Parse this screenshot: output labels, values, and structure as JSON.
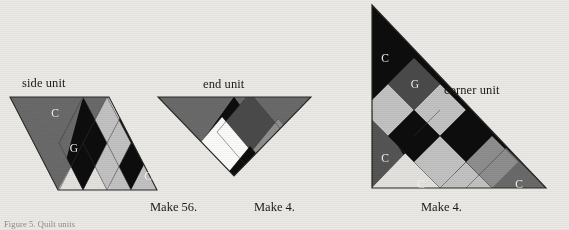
{
  "page": {
    "background_color": "#eceae6",
    "caption": "Figure 5. Quilt units"
  },
  "palette": {
    "black": "#0d0d0d",
    "dark_gray": "#4a4a4a",
    "medium_gray": "#8e8e8e",
    "light_gray": "#c2c2c2",
    "pale": "#e4e2de",
    "white": "#fbfbfa",
    "outline": "#2a2825",
    "label_text": "#1c1a18"
  },
  "units": [
    {
      "id": "side-unit",
      "title": "side unit",
      "make_label": "Make 56.",
      "shape": "parallelogram",
      "patch_labels": [
        {
          "text": "C",
          "x": 55,
          "y": 117
        },
        {
          "text": "G",
          "x": 74,
          "y": 150
        },
        {
          "text": "C",
          "x": 148,
          "y": 178
        }
      ]
    },
    {
      "id": "end-unit",
      "title": "end unit",
      "make_label": "Make 4.",
      "shape": "inverted-triangle",
      "patch_labels": []
    },
    {
      "id": "corner-unit",
      "title": "corner unit",
      "make_label": "Make 4.",
      "shape": "right-triangle",
      "patch_labels": [
        {
          "text": "C",
          "x": 385,
          "y": 61
        },
        {
          "text": "G",
          "x": 415,
          "y": 85
        },
        {
          "text": "C",
          "x": 385,
          "y": 158
        },
        {
          "text": "C",
          "x": 420,
          "y": 185
        },
        {
          "text": "C",
          "x": 518,
          "y": 185
        }
      ]
    }
  ],
  "titles": {
    "side_unit": "side unit",
    "end_unit": "end unit",
    "corner_unit": "corner unit"
  },
  "make_labels": {
    "side_unit": "Make 56.",
    "end_unit": "Make 4.",
    "corner_unit": "Make 4."
  }
}
